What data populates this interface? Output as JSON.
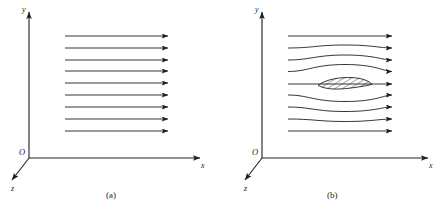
{
  "figure": {
    "panels": [
      {
        "id": "a",
        "caption": "(a)",
        "description": "uniform parallel flow field",
        "axes": {
          "x_label": "x",
          "y_label": "y",
          "z_label": "z",
          "origin_label": "O"
        },
        "flow": {
          "arrow_count": 9,
          "style": "straight",
          "x_start": 65,
          "x_end": 168,
          "y_values": [
            36,
            48,
            60,
            71,
            83,
            95,
            107,
            119,
            131
          ]
        },
        "body": null
      },
      {
        "id": "b",
        "caption": "(b)",
        "description": "flow deflected around a hatched airfoil section",
        "axes": {
          "x_label": "x",
          "y_label": "y",
          "z_label": "z",
          "origin_label": "O"
        },
        "flow": {
          "arrow_count": 9,
          "style": "curved-around-body",
          "x_start": 288,
          "x_end": 392,
          "y_values": [
            36,
            48,
            60,
            71,
            83,
            95,
            107,
            119,
            131
          ],
          "deflection": [
            0,
            -3.2,
            -5.2,
            -7.0,
            0,
            6.2,
            4.2,
            2.2,
            0
          ]
        },
        "body": {
          "type": "airfoil",
          "hatched": true,
          "hatch_line_count": 14,
          "x_start": 318,
          "x_end": 372,
          "center_y": 84,
          "thickness": 5.6
        }
      }
    ],
    "colors": {
      "line": "#1f1f1f",
      "axis": "#1f1f1f",
      "background": "#ffffff"
    }
  }
}
